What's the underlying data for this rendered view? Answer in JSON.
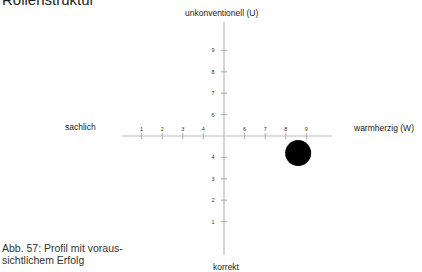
{
  "heading": "Rollenstruktur",
  "poles": {
    "top": "unkonventionell (U)",
    "bottom": "korrekt",
    "left": "sachlich",
    "right": "warmherzig (W)"
  },
  "caption": "Abb. 57: Profil mit voraus-sichtlichem Erfolg",
  "caption_lines": [
    "Abb. 57: Profil mit voraus-",
    "sichtlichem Erfolg"
  ],
  "colors": {
    "axis": "#bbbbbb",
    "tick": "#999999",
    "marker": "#000000",
    "text": "#222222"
  },
  "chart_data": {
    "type": "scatter",
    "title": "",
    "xlabel_left": "sachlich",
    "xlabel_right": "warmherzig (W)",
    "ylabel_top": "unkonventionell (U)",
    "ylabel_bottom": "korrekt",
    "x_ticks": [
      1,
      2,
      3,
      4,
      6,
      7,
      8,
      9
    ],
    "y_ticks": [
      1,
      2,
      3,
      4,
      6,
      7,
      8,
      9
    ],
    "axis_center": [
      5,
      5
    ],
    "xlim": [
      0,
      10
    ],
    "ylim": [
      0,
      10
    ],
    "grid": false,
    "points": [
      {
        "x": 8.6,
        "y": 4.2,
        "size": "large",
        "color": "#000000"
      }
    ]
  }
}
